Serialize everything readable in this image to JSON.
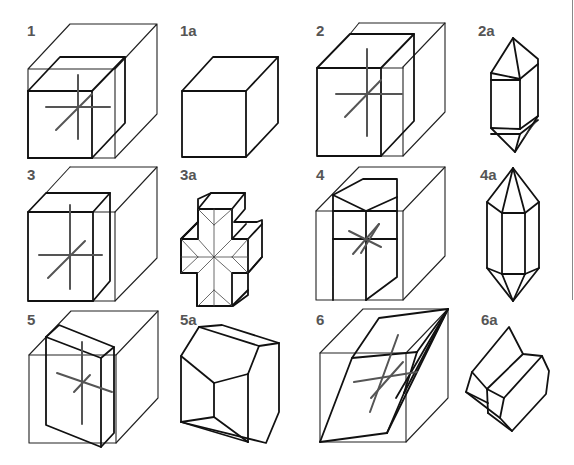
{
  "figure": {
    "colors": {
      "line": "#222222",
      "axis": "#555555",
      "label": "#555555",
      "background": "#ffffff"
    },
    "panels": [
      {
        "label": "1",
        "content": "cube-construction-with-axes",
        "result": "1a"
      },
      {
        "label": "1a",
        "content": "cube"
      },
      {
        "label": "2",
        "content": "cube-construction-with-axes",
        "result": "2a"
      },
      {
        "label": "2a",
        "content": "tetragonal-dipyramidal-prism"
      },
      {
        "label": "3",
        "content": "cube-construction-with-axes",
        "result": "3a"
      },
      {
        "label": "3a",
        "content": "cross-shaped-twin"
      },
      {
        "label": "4",
        "content": "cube-construction-with-axes",
        "result": "4a"
      },
      {
        "label": "4a",
        "content": "hexagonal-dipyramidal-prism"
      },
      {
        "label": "5",
        "content": "cube-construction-with-axes",
        "result": "5a"
      },
      {
        "label": "5a",
        "content": "monoclinic-prism"
      },
      {
        "label": "6",
        "content": "cube-construction-with-axes",
        "result": "6a"
      },
      {
        "label": "6a",
        "content": "triclinic-prism"
      }
    ]
  }
}
